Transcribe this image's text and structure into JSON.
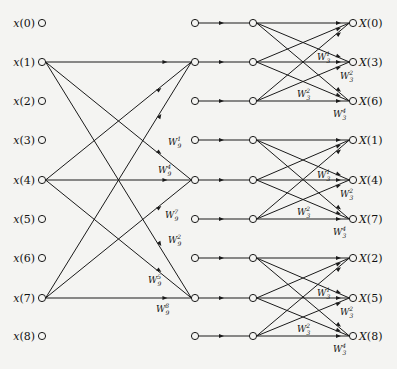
{
  "diagram": {
    "title": "",
    "type": "9-point FFT signal flow graph (radix-3)",
    "colors": {
      "line": "#1a1a1a",
      "background": "#f4f4f2"
    },
    "columns_x": [
      42,
      195,
      253,
      353
    ],
    "rows_y": [
      23,
      62,
      101,
      140,
      180,
      219,
      258,
      298,
      336
    ],
    "inputs": [
      "x(0)",
      "x(1)",
      "x(2)",
      "x(3)",
      "x(4)",
      "x(5)",
      "x(6)",
      "x(7)",
      "x(8)"
    ],
    "outputs": [
      "X(0)",
      "X(3)",
      "X(6)",
      "X(1)",
      "X(4)",
      "X(7)",
      "X(2)",
      "X(5)",
      "X(8)"
    ],
    "stage1_butterfly": {
      "inputs": [
        "x(1)",
        "x(4)",
        "x(7)"
      ],
      "targets_rows": [
        1,
        4,
        7
      ],
      "weight_labels": [
        {
          "base": "W",
          "sub": "9",
          "sup": "1",
          "x": 168,
          "y": 145
        },
        {
          "base": "W",
          "sub": "9",
          "sup": "4",
          "x": 158,
          "y": 173
        },
        {
          "base": "W",
          "sub": "9",
          "sup": "7",
          "x": 165,
          "y": 218
        },
        {
          "base": "W",
          "sub": "9",
          "sup": "2",
          "x": 168,
          "y": 243
        },
        {
          "base": "W",
          "sub": "9",
          "sup": "5",
          "x": 148,
          "y": 283
        },
        {
          "base": "W",
          "sub": "9",
          "sup": "8",
          "x": 156,
          "y": 312
        }
      ]
    },
    "stage2_butterflies": {
      "groups": [
        [
          0,
          1,
          2
        ],
        [
          3,
          4,
          5
        ],
        [
          6,
          7,
          8
        ]
      ],
      "weight_labels": [
        {
          "base": "W",
          "sub": "3",
          "sup": "1"
        },
        {
          "base": "W",
          "sub": "3",
          "sup": "2"
        },
        {
          "base": "W",
          "sub": "3",
          "sup": "2"
        },
        {
          "base": "W",
          "sub": "3",
          "sup": "4"
        }
      ]
    }
  }
}
